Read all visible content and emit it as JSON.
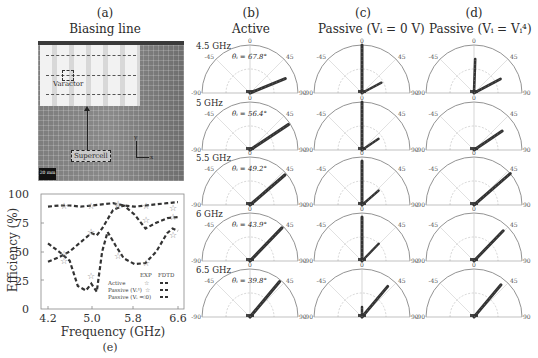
{
  "figure": {
    "panel_a": {
      "label": "(a)",
      "title": "Biasing line",
      "annotations": {
        "varactor": "Varactor",
        "supercell": "Supercell",
        "scale_bar": "20 mm",
        "axis_y": "y",
        "axis_x": "x"
      }
    },
    "panel_b": {
      "label": "(b)",
      "title": "Active"
    },
    "panel_c": {
      "label": "(c)",
      "title": "Passive (Vᵢ = 0 V)"
    },
    "panel_d": {
      "label": "(d)",
      "title": "Passive (Vᵢ = Vᵢ⁴)"
    },
    "panel_e": {
      "label": "(e)"
    },
    "polar_ticks": {
      "top": "0",
      "left": "-45",
      "right": "45",
      "far_left": "-90",
      "far_right": "90"
    },
    "rows": [
      {
        "freq": "4.5 GHz",
        "theta": "θᵢ = 67.8°",
        "b_angle": 67.8,
        "c_angle": 0,
        "c_side": 62,
        "d_angle": 4,
        "d_side": 62
      },
      {
        "freq": "5 GHz",
        "theta": "θᵢ = 56.4°",
        "b_angle": 56.4,
        "c_angle": 0,
        "c_side": 56,
        "d_angle": 56,
        "d_side": null
      },
      {
        "freq": "5.5 GHz",
        "theta": "θᵢ = 49.2°",
        "b_angle": 49.2,
        "c_angle": 0,
        "c_side": 49,
        "d_angle": 49,
        "d_side": null
      },
      {
        "freq": "6 GHz",
        "theta": "θᵢ = 43.9°",
        "b_angle": 43.9,
        "c_angle": 0,
        "c_side": 44,
        "d_angle": 44,
        "d_side": null
      },
      {
        "freq": "6.5 GHz",
        "theta": "θᵢ = 39.8°",
        "b_angle": 39.8,
        "c_angle": 40,
        "c_side": null,
        "d_angle": 40,
        "d_side": null
      }
    ]
  },
  "chart_data": {
    "type": "line",
    "title": "",
    "xlabel": "Frequency (GHz)",
    "ylabel": "Efficiency (%)",
    "xlim": [
      4.2,
      6.6
    ],
    "ylim": [
      0,
      100
    ],
    "xticks": [
      "4.2",
      "5.0",
      "5.8",
      "6.6"
    ],
    "yticks": [
      "0",
      "25",
      "50",
      "75",
      "100"
    ],
    "legend": {
      "header": [
        "EXP",
        "FDTD"
      ],
      "entries": [
        "Active",
        "Passive (Vᵢ⁴)",
        "Passive (Vᵢ = 0)"
      ]
    },
    "series": [
      {
        "name": "Active (FDTD)",
        "x": [
          4.2,
          4.4,
          4.6,
          4.8,
          5.0,
          5.2,
          5.4,
          5.6,
          5.8,
          6.0,
          6.2,
          6.4,
          6.6
        ],
        "y": [
          89,
          90,
          90,
          89,
          90,
          91,
          92,
          90,
          89,
          90,
          91,
          92,
          93
        ]
      },
      {
        "name": "Passive (Vi^4) (FDTD)",
        "x": [
          4.2,
          4.4,
          4.6,
          4.8,
          5.0,
          5.1,
          5.2,
          5.4,
          5.6,
          5.8,
          6.0,
          6.2,
          6.4,
          6.6
        ],
        "y": [
          41,
          45,
          50,
          58,
          66,
          64,
          70,
          86,
          90,
          82,
          70,
          75,
          79,
          80
        ]
      },
      {
        "name": "Passive (Vi=0) (FDTD)",
        "x": [
          4.2,
          4.4,
          4.6,
          4.75,
          4.9,
          5.0,
          5.1,
          5.2,
          5.3,
          5.45,
          5.6,
          5.8,
          6.0,
          6.2,
          6.4,
          6.5,
          6.6
        ],
        "y": [
          57,
          50,
          42,
          20,
          16,
          22,
          15,
          50,
          67,
          55,
          44,
          39,
          40,
          50,
          66,
          70,
          68
        ]
      },
      {
        "name": "Active (EXP)",
        "x": [
          4.5,
          5.0,
          5.5,
          6.0,
          6.5
        ],
        "y": [
          90,
          90,
          91,
          90,
          88
        ]
      },
      {
        "name": "Passive (Vi^4) (EXP)",
        "x": [
          4.5,
          5.0,
          5.5,
          6.0,
          6.5
        ],
        "y": [
          48,
          67,
          90,
          77,
          80
        ]
      },
      {
        "name": "Passive (Vi=0) (EXP)",
        "x": [
          4.5,
          5.0,
          5.5,
          6.0,
          6.5
        ],
        "y": [
          42,
          29,
          46,
          40,
          64
        ]
      }
    ]
  }
}
